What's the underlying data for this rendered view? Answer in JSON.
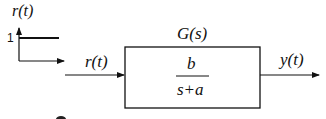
{
  "diagram": {
    "type": "block-diagram",
    "step_plot": {
      "ylabel": "r(t)",
      "level_label": "1"
    },
    "input_label": "r(t)",
    "block": {
      "name": "G(s)",
      "numerator": "b",
      "denominator": "s+a"
    },
    "output_label": "y(t)"
  }
}
